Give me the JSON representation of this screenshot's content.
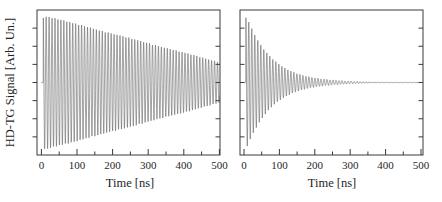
{
  "figure": {
    "ylabel": "HD-TG Signal [Arb. Un.]"
  },
  "chart_data": [
    {
      "panel": "left",
      "type": "line",
      "title": "",
      "xlabel": "Time [ns]",
      "ylabel": "HD-TG Signal [Arb. Un.]",
      "xlim": [
        0,
        500
      ],
      "ylim": [
        -1.1,
        1.1
      ],
      "x_major_ticks": [
        0,
        100,
        200,
        300,
        400,
        500
      ],
      "x_minor_ticks": [
        50,
        150,
        250,
        350,
        450
      ],
      "y_tick_labels": [],
      "grid": "off",
      "legend": "none",
      "series": [
        {
          "name": "HD-TG oscillating signal, slow acoustic damping",
          "model": "damped_cosine",
          "baseline": 0,
          "envelope": "linear",
          "amplitude_start": 1.0,
          "amplitude_at_500ns": 0.3,
          "period_ns": 8.3,
          "t_start_ns": 5,
          "t_end_ns": 500
        }
      ]
    },
    {
      "panel": "right",
      "type": "line",
      "title": "",
      "xlabel": "Time [ns]",
      "ylabel": "HD-TG Signal [Arb. Un.]",
      "xlim": [
        0,
        500
      ],
      "ylim": [
        -1.1,
        1.1
      ],
      "x_major_ticks": [
        0,
        100,
        200,
        300,
        400,
        500
      ],
      "x_minor_ticks": [
        50,
        150,
        250,
        350,
        450
      ],
      "y_tick_labels": [],
      "grid": "off",
      "legend": "none",
      "series": [
        {
          "name": "HD-TG oscillating signal, fast acoustic damping",
          "model": "damped_cosine",
          "baseline": 0,
          "envelope": "exponential",
          "amplitude_start": 1.0,
          "decay_tau_ns": 72,
          "period_ns": 8.5,
          "t_start_ns": 5,
          "t_end_ns": 500
        }
      ]
    }
  ]
}
